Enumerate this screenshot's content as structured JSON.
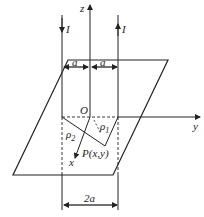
{
  "diagram": {
    "axes": {
      "z_label": "z",
      "y_label": "y",
      "x_label": "x",
      "origin_label": "O"
    },
    "wires": [
      {
        "name": "left-wire",
        "current_label": "I",
        "direction": "down"
      },
      {
        "name": "right-wire",
        "current_label": "I",
        "direction": "up"
      }
    ],
    "dimensions": {
      "left_half": "a",
      "right_half": "a",
      "total": "2a"
    },
    "point": {
      "label": "P(x,y)",
      "rho1": "ρ",
      "rho1_sub": "1",
      "rho2": "ρ",
      "rho2_sub": "2"
    },
    "colors": {
      "line": "#222222",
      "background": "#ffffff"
    }
  }
}
